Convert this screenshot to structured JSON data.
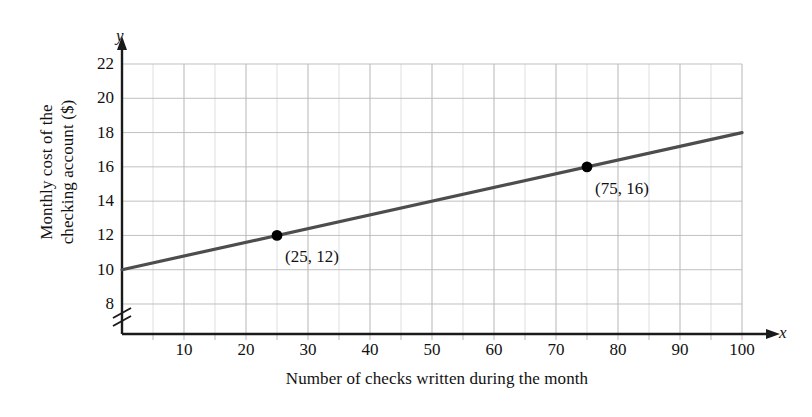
{
  "chart_data": {
    "type": "line",
    "title": "",
    "xlabel": "Number of checks written during the month",
    "ylabel": "Monthly cost of the\ncheckingaccount ($)",
    "ylabel_line1": "Monthly cost of the",
    "ylabel_line2": "checking account ($)",
    "x_axis_letter": "x",
    "y_axis_letter": "y",
    "xlim": [
      0,
      100
    ],
    "ylim": [
      8,
      22
    ],
    "y_axis_break": true,
    "grid": true,
    "grid_x_step": 5,
    "grid_y_step": 2,
    "xticks": [
      10,
      20,
      30,
      40,
      50,
      60,
      70,
      80,
      90,
      100
    ],
    "xtick_labels": [
      "10",
      "20",
      "30",
      "40",
      "50",
      "60",
      "70",
      "80",
      "90",
      "100"
    ],
    "yticks": [
      8,
      10,
      12,
      14,
      16,
      18,
      20,
      22
    ],
    "ytick_labels": [
      "8",
      "10",
      "12",
      "14",
      "16",
      "18",
      "20",
      "22"
    ],
    "legend": null,
    "series": [
      {
        "name": "monthly cost",
        "type": "line",
        "slope": 0.08,
        "intercept": 10,
        "x": [
          0,
          100
        ],
        "y": [
          10,
          18
        ],
        "color": "#4d4d4d"
      }
    ],
    "points": [
      {
        "x": 25,
        "y": 12,
        "label": "(25, 12)",
        "color": "#000000"
      },
      {
        "x": 75,
        "y": 16,
        "label": "(75, 16)",
        "color": "#000000"
      }
    ],
    "annotations": [
      {
        "text": "(25, 12)",
        "x": 25,
        "y": 12,
        "position": "below-right"
      },
      {
        "text": "(75, 16)",
        "x": 75,
        "y": 16,
        "position": "below-right"
      }
    ],
    "colors": {
      "line": "#4d4d4d",
      "grid": "#b9b9b9",
      "axis": "#1a1a1a",
      "point": "#000000",
      "background": "#ffffff"
    }
  }
}
